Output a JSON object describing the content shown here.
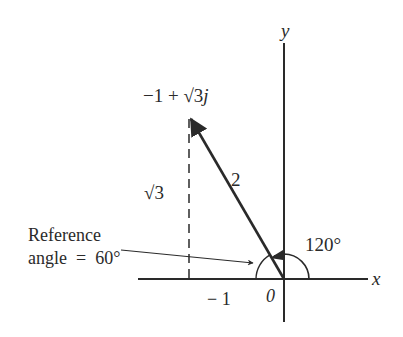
{
  "figure": {
    "type": "complex-plane-vector",
    "colors": {
      "ink": "#2a2a2a",
      "background": "#ffffff"
    },
    "axes": {
      "x_label": "x",
      "y_label": "y",
      "origin_label": "0",
      "tick_label_neg1": "− 1"
    },
    "vector": {
      "point_label": "−1 + √3j",
      "point_label_main": "−1 + √3",
      "point_label_j": "j",
      "magnitude_label": "2",
      "real": -1,
      "imag": 1.732,
      "magnitude": 2,
      "angle_deg": 120
    },
    "height_label": "√3",
    "angle_label": "120°",
    "reference_angle": {
      "line1": "Reference",
      "line2": "angle  =  60°",
      "value_deg": 60
    }
  }
}
